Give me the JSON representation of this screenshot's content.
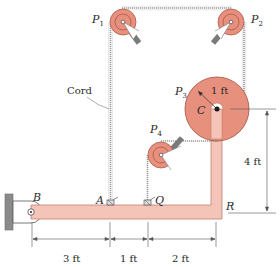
{
  "diagram": {
    "labels": {
      "p1": "P",
      "p1_sub": "1",
      "p2": "P",
      "p2_sub": "2",
      "p3": "P",
      "p3_sub": "3",
      "p4": "P",
      "p4_sub": "4",
      "c": "C",
      "a": "A",
      "b": "B",
      "q": "Q",
      "r": "R",
      "cord": "Cord",
      "radius": "1 ft"
    },
    "dimensions": {
      "horizontal": [
        "3 ft",
        "1 ft",
        "2 ft"
      ],
      "vertical": "4 ft"
    },
    "colors": {
      "pulley_fill": "#e8907e",
      "pulley_stroke": "#a05040",
      "bar_fill": "#f4c4b8",
      "bar_stroke": "#c08070",
      "support": "#8a8a8a",
      "cord": "#9a9a9a",
      "dim_line": "#555555"
    }
  }
}
